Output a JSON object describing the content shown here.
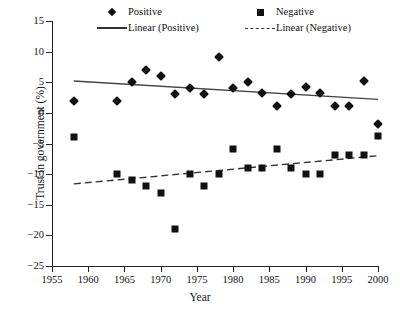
{
  "chart_data": {
    "type": "scatter",
    "title": "",
    "xlabel": "Year",
    "ylabel": "Trust in government (%)",
    "xlim": [
      1955,
      2000
    ],
    "ylim": [
      -25,
      15
    ],
    "xticks": [
      1955,
      1960,
      1965,
      1970,
      1975,
      1980,
      1985,
      1990,
      1995,
      2000
    ],
    "yticks": [
      15,
      10,
      5,
      0,
      -5,
      -10,
      -15,
      -20,
      -25
    ],
    "xtick_labels": [
      "1955",
      "1960",
      "1965",
      "1970",
      "1975",
      "1980",
      "1985",
      "1990",
      "1995",
      "2000"
    ],
    "ytick_labels": [
      "15",
      "10",
      "5",
      "0",
      "−5",
      "−10",
      "−15",
      "−20",
      "−25"
    ],
    "grid": false,
    "legend_position": "top-inside",
    "legend": [
      {
        "label": "Positive",
        "marker": "diamond",
        "color": "#111111"
      },
      {
        "label": "Negative",
        "marker": "square",
        "color": "#111111"
      },
      {
        "label": "Linear (Positive)",
        "marker": "solid-line",
        "color": "#333333"
      },
      {
        "label": "Linear (Negative)",
        "marker": "dashed-line",
        "color": "#333333"
      }
    ],
    "series": [
      {
        "name": "Positive",
        "marker": "diamond",
        "color": "#111111",
        "points": [
          {
            "x": 1958,
            "y": 2
          },
          {
            "x": 1964,
            "y": 2
          },
          {
            "x": 1966,
            "y": 5
          },
          {
            "x": 1968,
            "y": 7
          },
          {
            "x": 1970,
            "y": 6
          },
          {
            "x": 1972,
            "y": 3.1
          },
          {
            "x": 1974,
            "y": 4.1
          },
          {
            "x": 1976,
            "y": 3.1
          },
          {
            "x": 1978,
            "y": 9.1
          },
          {
            "x": 1980,
            "y": 4.1
          },
          {
            "x": 1982,
            "y": 5.1
          },
          {
            "x": 1984,
            "y": 3.2
          },
          {
            "x": 1986,
            "y": 1.2
          },
          {
            "x": 1988,
            "y": 3.1
          },
          {
            "x": 1990,
            "y": 4.2
          },
          {
            "x": 1992,
            "y": 3.2
          },
          {
            "x": 1994,
            "y": 1.2
          },
          {
            "x": 1996,
            "y": 1.2
          },
          {
            "x": 1998,
            "y": 5.2
          },
          {
            "x": 2000,
            "y": -1.8
          }
        ]
      },
      {
        "name": "Negative",
        "marker": "square",
        "color": "#111111",
        "points": [
          {
            "x": 1958,
            "y": -4
          },
          {
            "x": 1964,
            "y": -10
          },
          {
            "x": 1966,
            "y": -11
          },
          {
            "x": 1968,
            "y": -12
          },
          {
            "x": 1970,
            "y": -13
          },
          {
            "x": 1972,
            "y": -19
          },
          {
            "x": 1974,
            "y": -10
          },
          {
            "x": 1976,
            "y": -12
          },
          {
            "x": 1978,
            "y": -10
          },
          {
            "x": 1980,
            "y": -5.9
          },
          {
            "x": 1982,
            "y": -9
          },
          {
            "x": 1984,
            "y": -9
          },
          {
            "x": 1986,
            "y": -5.9
          },
          {
            "x": 1988,
            "y": -9
          },
          {
            "x": 1990,
            "y": -10
          },
          {
            "x": 1992,
            "y": -10
          },
          {
            "x": 1994,
            "y": -6.8
          },
          {
            "x": 1996,
            "y": -6.8
          },
          {
            "x": 1998,
            "y": -6.8
          },
          {
            "x": 2000,
            "y": -3.8
          }
        ]
      }
    ],
    "trendlines": [
      {
        "name": "Linear (Positive)",
        "style": "solid",
        "color": "#444444",
        "x_start": 1958,
        "y_start": 5.2,
        "x_end": 2000,
        "y_end": 2.2
      },
      {
        "name": "Linear (Negative)",
        "style": "dashed",
        "color": "#333333",
        "x_start": 1958,
        "y_start": -11.6,
        "x_end": 2000,
        "y_end": -7.0
      }
    ]
  }
}
